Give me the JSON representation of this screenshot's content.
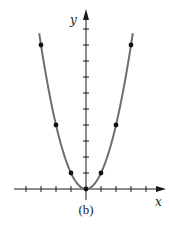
{
  "chart_data": {
    "type": "line",
    "title": "",
    "caption": "(b)",
    "xlabel": "x",
    "ylabel": "y",
    "function": "y = x^2",
    "x": [
      -3,
      -2,
      -1,
      0,
      1,
      2,
      3
    ],
    "series": [
      {
        "name": "y = x^2",
        "values": [
          9,
          4,
          1,
          0,
          1,
          4,
          9
        ],
        "markers": true
      }
    ],
    "xlim": [
      -4,
      5
    ],
    "ylim": [
      0,
      10
    ],
    "x_ticks": [
      -4,
      -3,
      -2,
      -1,
      1,
      2,
      3,
      4
    ],
    "y_ticks": [
      1,
      2,
      3,
      4,
      5,
      6,
      7,
      8,
      9,
      10
    ],
    "tick_labels_shown": false,
    "grid": false,
    "legend": null,
    "colors": {
      "curve": "#6e6e6e",
      "axes": "#1a1a1a",
      "points": "#111111"
    }
  },
  "labels": {
    "x_axis": "x",
    "y_axis": "y",
    "caption": "(b)"
  },
  "layout": {
    "origin_px": [
      86,
      189
    ],
    "x_unit_px": 15,
    "y_unit_px": 16
  }
}
